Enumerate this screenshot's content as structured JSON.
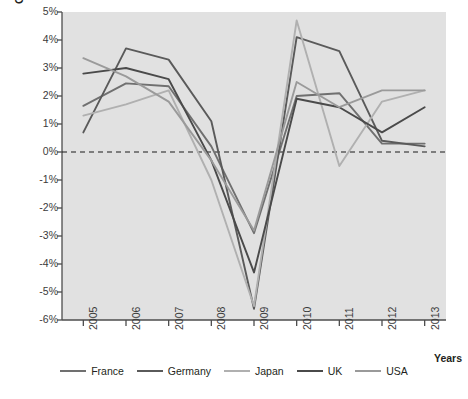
{
  "chart_data": {
    "type": "line",
    "title": "",
    "xlabel": "Years",
    "ylabel": "GDP growth (%)",
    "categories": [
      "2005",
      "2006",
      "2007",
      "2008",
      "2009",
      "2010",
      "2011",
      "2012",
      "2013"
    ],
    "x": [
      2005,
      2006,
      2007,
      2008,
      2009,
      2010,
      2011,
      2012,
      2013
    ],
    "ylim": [
      -6,
      5
    ],
    "ytick_labels": [
      "5%",
      "4%",
      "3%",
      "2%",
      "1%",
      "0%",
      "-1%",
      "-2%",
      "-3%",
      "-4%",
      "-5%",
      "-6%"
    ],
    "ytick_values": [
      5,
      4,
      3,
      2,
      1,
      0,
      -1,
      -2,
      -3,
      -4,
      -5,
      -6
    ],
    "grid": false,
    "zero_line": true,
    "zero_line_style": "dashed",
    "legend_position": "bottom",
    "plot_background": "#e1e1e1",
    "series": [
      {
        "name": "France",
        "color": "#707070",
        "values": [
          1.65,
          2.45,
          2.35,
          0.2,
          -2.9,
          2.0,
          2.1,
          0.3,
          0.3
        ]
      },
      {
        "name": "Germany",
        "color": "#5a5a5a",
        "values": [
          0.7,
          3.7,
          3.3,
          1.1,
          -5.6,
          4.1,
          3.6,
          0.4,
          0.2
        ]
      },
      {
        "name": "Japan",
        "color": "#b0b0b0",
        "values": [
          1.3,
          1.7,
          2.2,
          -1.0,
          -5.5,
          4.7,
          -0.5,
          1.8,
          2.2
        ]
      },
      {
        "name": "UK",
        "color": "#4a4a4a",
        "values": [
          2.8,
          3.0,
          2.6,
          -0.3,
          -4.3,
          1.9,
          1.6,
          0.7,
          1.6
        ]
      },
      {
        "name": "USA",
        "color": "#9a9a9a",
        "values": [
          3.35,
          2.7,
          1.8,
          -0.3,
          -2.8,
          2.5,
          1.6,
          2.2,
          2.2
        ]
      }
    ]
  },
  "legend": {
    "items": [
      {
        "label": "France"
      },
      {
        "label": "Germany"
      },
      {
        "label": "Japan"
      },
      {
        "label": "UK"
      },
      {
        "label": "USA"
      }
    ]
  }
}
